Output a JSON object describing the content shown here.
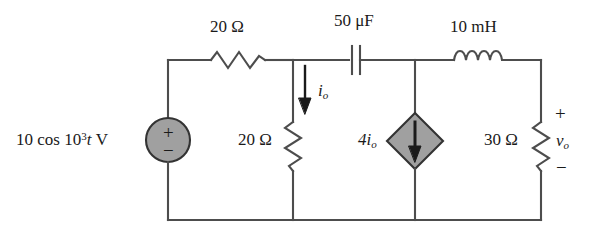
{
  "figure": {
    "kind": "circuit-schematic",
    "colors": {
      "wire": "#4d4d4d",
      "component_fill": "#a0a0a0",
      "component_stroke": "#333333",
      "text": "#1a1a1a",
      "background": "#ffffff"
    }
  },
  "labels": {
    "source": {
      "amplitude": "10 cos 10",
      "exponent": "3",
      "variable": "t",
      "unit": "V",
      "plus": "+",
      "minus": "−"
    },
    "resistor_series": "20 Ω",
    "capacitor": "50 μF",
    "inductor": "10 mH",
    "resistor_shunt": "20 Ω",
    "current_io": "i",
    "current_io_sub": "o",
    "dependent_source": "4i",
    "dependent_source_sub": "o",
    "resistor_load": "30 Ω",
    "voltage_vo": "v",
    "voltage_vo_sub": "o",
    "voltage_plus": "+",
    "voltage_minus": "−"
  },
  "components": [
    {
      "name": "voltage-source",
      "type": "independent-ac-voltage-source",
      "value": "10 cos 10^3 t V",
      "shape": "circle",
      "orientation": "vertical",
      "polarity_top": "+",
      "polarity_bottom": "−"
    },
    {
      "name": "resistor-20-ohm-series",
      "type": "resistor",
      "value": "20 Ω",
      "orientation": "horizontal"
    },
    {
      "name": "capacitor-50-uf",
      "type": "capacitor",
      "value": "50 μF",
      "orientation": "horizontal"
    },
    {
      "name": "inductor-10-mh",
      "type": "inductor",
      "value": "10 mH",
      "orientation": "horizontal"
    },
    {
      "name": "resistor-20-ohm-shunt",
      "type": "resistor",
      "value": "20 Ω",
      "orientation": "vertical",
      "current_label": "i_o",
      "current_direction": "down"
    },
    {
      "name": "dependent-current-source",
      "type": "current-controlled-current-source",
      "value": "4i_o",
      "shape": "diamond",
      "orientation": "vertical",
      "arrow_direction": "down"
    },
    {
      "name": "resistor-30-ohm-load",
      "type": "resistor",
      "value": "30 Ω",
      "orientation": "vertical",
      "voltage_label": "v_o",
      "polarity_top": "+",
      "polarity_bottom": "−"
    }
  ]
}
